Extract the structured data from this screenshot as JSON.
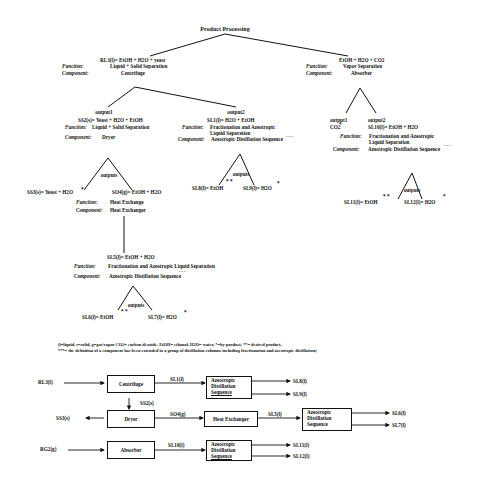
{
  "tree": {
    "root": "Product Processing",
    "labels": {
      "function": "Function:",
      "component": "Component:",
      "outputs": "outputs",
      "output1": "output1",
      "output2": "output2"
    },
    "left_branch": {
      "stream": "RL3(l)= EtOH + H2O + yeast",
      "function": "Liquid + Solid Separation",
      "component": "Centrifuge",
      "output1": {
        "stream": "SS2(s)= Yeast + H2O + EtOH",
        "function": "Liquid + Solid Separation",
        "component": "Dryer",
        "outputs": {
          "left": {
            "stream": "SS3(s)= Yeast + H2O",
            "mark": "*"
          },
          "right": {
            "stream": "SO4(g)= EtOH + H2O",
            "function": "Heat Exchange",
            "component": "Heat Exchanger",
            "child": {
              "stream": "SL5(l)= EtOH + H2O",
              "function": "Fractionation and Azeotropic Liquid Separation",
              "component": "Azeotropic Distillation Sequence",
              "ellipsis": ". . .",
              "outputs": {
                "left": "SL6(l)= EtOH",
                "left_mark": "* *",
                "right": "SL7(l)= H2O",
                "right_mark": "*"
              }
            }
          }
        }
      },
      "output2": {
        "stream": "SL1(l)= H2O + EtOH",
        "function_line1": "Fractionation and Azeotropic",
        "function_line2": "Liquid Separation",
        "component": "Azeotropic Distillation Sequence",
        "ellipsis": ". . .",
        "outputs": {
          "left": "SL8(l)= EtOH",
          "left_mark": "* *",
          "right": "SL9(l)= H2O",
          "right_mark": "*"
        }
      }
    },
    "right_branch": {
      "stream": "EtOH + H2O + CO2",
      "function": "Vapor Separation",
      "component": "Absorber",
      "output1": {
        "stream": "CO2",
        "mark": "*"
      },
      "output2": {
        "stream": "SL10(l)= EtOH + H2O",
        "function_line1": "Fractionation and Azeotropic",
        "function_line2": "Liquid Separation",
        "component": "Azeotropic Distillation Sequence",
        "ellipsis": ". . .",
        "outputs": {
          "left": "SL11(l)= EtOH",
          "left_mark": "* *",
          "right": "SL12(l)= H2O",
          "right_mark": "*"
        }
      }
    }
  },
  "legend": {
    "line1": "(l=liquid, s=solid, g=gas/vapor CO2= carbon di oxide, EtOH= ethanol, H2O= water, *=by-product, **= desired product,",
    "line2": "***=  the definition of a component has been extended to a group of distillation columns  including fractionation and azeotropic distillation)"
  },
  "flowsheet": {
    "inputs": {
      "rl3": "RL3(l)",
      "ss3": "SS3(s)",
      "rg2": "RG2(g)"
    },
    "blocks": {
      "centrifuge": "Centrifuge",
      "dryer": "Dryer",
      "absorber": "Absorber",
      "heat_exchanger": "Heat Exchanger",
      "ads1": [
        "Azeotropic",
        "Distillation",
        "Sequence"
      ],
      "ads2": [
        "Azeotropic",
        "Distillation",
        "Sequence"
      ],
      "ads3": [
        "Azeotropic",
        "Distillation",
        "Sequence"
      ]
    },
    "streams": {
      "sl1": "SL1(l)",
      "ss2": "SS2(s)",
      "so4": "SO4(g)",
      "sl5": "SL5(l)",
      "sl10": "SL10(l)",
      "sl8": "SL8(l)",
      "sl9": "SL9(l)",
      "sl6": "SL6(l)",
      "sl7": "SL7(l)",
      "sl11": "SL11(l)",
      "sl12": "SL12(l)"
    }
  }
}
